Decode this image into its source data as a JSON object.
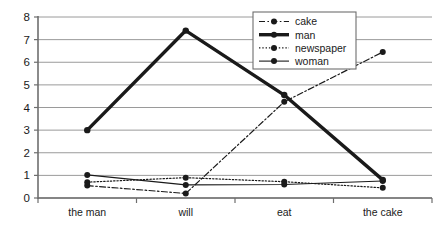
{
  "chart_data": {
    "type": "line",
    "title": "",
    "subtitle": "",
    "xlabel": "",
    "ylabel": "",
    "categories": [
      "the man",
      "will",
      "eat",
      "the cake"
    ],
    "ylim": [
      0,
      8
    ],
    "yticks": [
      0,
      1,
      2,
      3,
      4,
      5,
      6,
      7,
      8
    ],
    "grid": "horizontal",
    "legend_position": "top-right",
    "series": [
      {
        "name": "cake",
        "style": "dash-dot",
        "color": "#1a1a1a",
        "marker": "circle",
        "values": [
          0.55,
          0.2,
          4.25,
          6.45
        ]
      },
      {
        "name": "man",
        "style": "solid-thick",
        "color": "#1a1a1a",
        "marker": "circle",
        "values": [
          3.0,
          7.4,
          4.55,
          0.8
        ]
      },
      {
        "name": "newspaper",
        "style": "dotted",
        "color": "#1a1a1a",
        "marker": "circle",
        "values": [
          0.7,
          0.9,
          0.72,
          0.45
        ]
      },
      {
        "name": "woman",
        "style": "solid-thin",
        "color": "#1a1a1a",
        "marker": "circle",
        "values": [
          1.02,
          0.58,
          0.6,
          0.75
        ]
      }
    ]
  },
  "axis": {
    "y_tick_labels": [
      "0",
      "1",
      "2",
      "3",
      "4",
      "5",
      "6",
      "7",
      "8"
    ],
    "x_tick_labels": [
      "the man",
      "will",
      "eat",
      "the cake"
    ]
  },
  "legend": {
    "items": [
      {
        "label": "cake"
      },
      {
        "label": "man"
      },
      {
        "label": "newspaper"
      },
      {
        "label": "woman"
      }
    ]
  },
  "colors": {
    "ink": "#1a1a1a",
    "grid": "#9a9a9a",
    "axis": "#6e6e6e",
    "legend_border": "#6e6e6e",
    "background": "#ffffff"
  }
}
